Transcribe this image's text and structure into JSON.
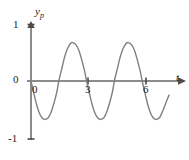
{
  "figure": {
    "name": "particular-solution-oscillation-plot",
    "background_color": "#ffffff"
  },
  "axes": {
    "y_axis": {
      "label": "y",
      "label_subscript": "p",
      "tick_labels": [
        "1",
        "0",
        "-1"
      ],
      "tick_values": [
        1,
        0,
        -1
      ],
      "color": "#8c8c8c",
      "arrow": "up"
    },
    "x_axis": {
      "label": "t",
      "origin_label": "0",
      "tick_labels": [
        "3",
        "6"
      ],
      "tick_values": [
        3,
        6
      ],
      "color": "#8c8c8c",
      "arrow": "right"
    }
  },
  "curve": {
    "color": "#808080",
    "stroke_width": 1.4
  },
  "chart_data": {
    "type": "line",
    "title": "",
    "xlabel": "t",
    "ylabel": "y_p",
    "xlim": [
      0,
      7.2
    ],
    "ylim": [
      -1,
      1
    ],
    "grid": false,
    "legend": null,
    "xticks": [
      0,
      3,
      6
    ],
    "xticklabels": [
      "0",
      "3",
      "6"
    ],
    "yticks": [
      -1,
      0,
      1
    ],
    "yticklabels": [
      "-1",
      "0",
      "1"
    ],
    "series": [
      {
        "name": "y_p(t)",
        "description": "sinusoidal oscillation of amplitude about 0.68 and period about 2.9, starting at the origin and going negative first",
        "amplitude": 0.68,
        "period": 2.9,
        "phase": "negative-first",
        "x": [
          0.0,
          0.15,
          0.3,
          0.45,
          0.6,
          0.73,
          0.9,
          1.05,
          1.2,
          1.35,
          1.45,
          1.6,
          1.75,
          1.9,
          2.05,
          2.18,
          2.35,
          2.5,
          2.65,
          2.8,
          2.9,
          3.05,
          3.2,
          3.35,
          3.5,
          3.63,
          3.8,
          3.95,
          4.1,
          4.25,
          4.35,
          4.5,
          4.65,
          4.8,
          4.95,
          5.08,
          5.25,
          5.4,
          5.55,
          5.7,
          5.8,
          5.95,
          6.1,
          6.25,
          6.4,
          6.53,
          6.7,
          6.85,
          7.0,
          7.2
        ],
        "y": [
          0.0,
          -0.22,
          -0.43,
          -0.58,
          -0.66,
          -0.68,
          -0.65,
          -0.55,
          -0.39,
          -0.19,
          0.0,
          0.21,
          0.42,
          0.57,
          0.66,
          0.68,
          0.64,
          0.54,
          0.37,
          0.17,
          0.0,
          -0.22,
          -0.43,
          -0.58,
          -0.66,
          -0.68,
          -0.65,
          -0.55,
          -0.39,
          -0.19,
          0.0,
          0.21,
          0.42,
          0.57,
          0.66,
          0.68,
          0.64,
          0.54,
          0.37,
          0.17,
          0.0,
          -0.22,
          -0.43,
          -0.58,
          -0.66,
          -0.68,
          -0.65,
          -0.55,
          -0.42,
          -0.25
        ]
      }
    ]
  }
}
